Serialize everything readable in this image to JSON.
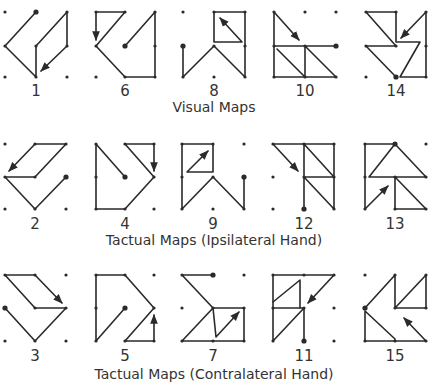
{
  "figure": {
    "rows": [
      {
        "caption": "Visual Maps",
        "maps": [
          {
            "label": "1"
          },
          {
            "label": "6"
          },
          {
            "label": "8"
          },
          {
            "label": "10"
          },
          {
            "label": "14"
          }
        ]
      },
      {
        "caption": "Tactual Maps (Ipsilateral Hand)",
        "maps": [
          {
            "label": "2"
          },
          {
            "label": "4"
          },
          {
            "label": "9"
          },
          {
            "label": "12"
          },
          {
            "label": "13"
          }
        ]
      },
      {
        "caption": "Tactual Maps (Contralateral Hand)",
        "maps": [
          {
            "label": "3"
          },
          {
            "label": "5"
          },
          {
            "label": "7"
          },
          {
            "label": "11"
          },
          {
            "label": "15"
          }
        ]
      }
    ],
    "grid": "3x3 dot grid per map",
    "colors": {
      "ink": "#2a2a2a",
      "background": "#ffffff"
    }
  }
}
